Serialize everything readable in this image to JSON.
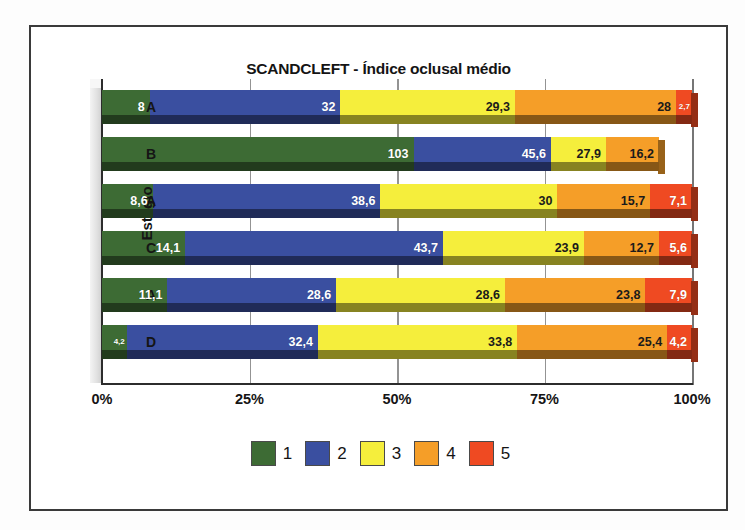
{
  "chart_data": {
    "type": "bar",
    "subtype": "stacked-horizontal-100-percent-3d",
    "title": "SCANDCLEFT - Índice oclusal médio",
    "xlabel": "",
    "ylabel": "Estágio",
    "categories": [
      "A",
      "B",
      "A",
      "C",
      "A",
      "D"
    ],
    "xticks": [
      "0%",
      "25%",
      "50%",
      "75%",
      "100%"
    ],
    "xlim": [
      0,
      100
    ],
    "grid": true,
    "legend": {
      "position": "bottom",
      "entries": [
        {
          "label": "1",
          "color": "#3d6b34"
        },
        {
          "label": "2",
          "color": "#3a4fa0"
        },
        {
          "label": "3",
          "color": "#f5ee3c"
        },
        {
          "label": "4",
          "color": "#f59e28"
        },
        {
          "label": "5",
          "color": "#ef4a22"
        }
      ]
    },
    "series": [
      {
        "name": "1",
        "color": "#3d6b34",
        "values": [
          8,
          103,
          8.6,
          14.1,
          11.1,
          4.2
        ]
      },
      {
        "name": "2",
        "color": "#3a4fa0",
        "values": [
          32,
          45.6,
          38.6,
          43.7,
          28.6,
          32.4
        ]
      },
      {
        "name": "3",
        "color": "#f5ee3c",
        "values": [
          29.3,
          27.9,
          30,
          23.9,
          28.6,
          33.8
        ]
      },
      {
        "name": "4",
        "color": "#f59e28",
        "values": [
          28,
          16.2,
          15.7,
          12.7,
          23.8,
          25.4
        ]
      },
      {
        "name": "5",
        "color": "#ef4a22",
        "values": [
          2.7,
          null,
          7.1,
          5.6,
          7.9,
          4.2
        ]
      }
    ],
    "rows": [
      {
        "category": "A",
        "segments": [
          {
            "series": "1",
            "label": "8",
            "percent": 8.1,
            "color": "#3d6b34",
            "label_color": "white",
            "label_size": "normal"
          },
          {
            "series": "2",
            "label": "32",
            "percent": 32.3,
            "color": "#3a4fa0",
            "label_color": "white",
            "label_size": "normal"
          },
          {
            "series": "3",
            "label": "29,3",
            "percent": 29.6,
            "color": "#f5ee3c",
            "label_color": "dark",
            "label_size": "normal"
          },
          {
            "series": "4",
            "label": "28",
            "percent": 27.3,
            "color": "#f59e28",
            "label_color": "dark",
            "label_size": "normal"
          },
          {
            "series": "5",
            "label": "2,7",
            "percent": 2.7,
            "color": "#ef4a22",
            "label_color": "white",
            "label_size": "small"
          }
        ]
      },
      {
        "category": "B",
        "segments": [
          {
            "series": "1",
            "label": "103",
            "percent": 52.8,
            "color": "#3d6b34",
            "label_color": "white",
            "label_size": "normal"
          },
          {
            "series": "2",
            "label": "45,6",
            "percent": 23.3,
            "color": "#3a4fa0",
            "label_color": "white",
            "label_size": "normal"
          },
          {
            "series": "3",
            "label": "27,9",
            "percent": 9.3,
            "color": "#f5ee3c",
            "label_color": "dark",
            "label_size": "normal"
          },
          {
            "series": "4",
            "label": "16,2",
            "percent": 9.0,
            "color": "#f59e28",
            "label_color": "dark",
            "label_size": "normal"
          }
        ]
      },
      {
        "category": "A",
        "segments": [
          {
            "series": "1",
            "label": "8,6",
            "percent": 8.6,
            "color": "#3d6b34",
            "label_color": "white",
            "label_size": "normal"
          },
          {
            "series": "2",
            "label": "38,6",
            "percent": 38.6,
            "color": "#3a4fa0",
            "label_color": "white",
            "label_size": "normal"
          },
          {
            "series": "3",
            "label": "30",
            "percent": 30.0,
            "color": "#f5ee3c",
            "label_color": "dark",
            "label_size": "normal"
          },
          {
            "series": "4",
            "label": "15,7",
            "percent": 15.7,
            "color": "#f59e28",
            "label_color": "dark",
            "label_size": "normal"
          },
          {
            "series": "5",
            "label": "7,1",
            "percent": 7.1,
            "color": "#ef4a22",
            "label_color": "white",
            "label_size": "normal"
          }
        ]
      },
      {
        "category": "C",
        "segments": [
          {
            "series": "1",
            "label": "14,1",
            "percent": 14.1,
            "color": "#3d6b34",
            "label_color": "white",
            "label_size": "normal"
          },
          {
            "series": "2",
            "label": "43,7",
            "percent": 43.7,
            "color": "#3a4fa0",
            "label_color": "white",
            "label_size": "normal"
          },
          {
            "series": "3",
            "label": "23,9",
            "percent": 23.9,
            "color": "#f5ee3c",
            "label_color": "dark",
            "label_size": "normal"
          },
          {
            "series": "4",
            "label": "12,7",
            "percent": 12.7,
            "color": "#f59e28",
            "label_color": "dark",
            "label_size": "normal"
          },
          {
            "series": "5",
            "label": "5,6",
            "percent": 5.6,
            "color": "#ef4a22",
            "label_color": "white",
            "label_size": "normal"
          }
        ]
      },
      {
        "category": "A",
        "segments": [
          {
            "series": "1",
            "label": "11,1",
            "percent": 11.1,
            "color": "#3d6b34",
            "label_color": "white",
            "label_size": "normal"
          },
          {
            "series": "2",
            "label": "28,6",
            "percent": 28.6,
            "color": "#3a4fa0",
            "label_color": "white",
            "label_size": "normal"
          },
          {
            "series": "3",
            "label": "28,6",
            "percent": 28.6,
            "color": "#f5ee3c",
            "label_color": "dark",
            "label_size": "normal"
          },
          {
            "series": "4",
            "label": "23,8",
            "percent": 23.8,
            "color": "#f59e28",
            "label_color": "dark",
            "label_size": "normal"
          },
          {
            "series": "5",
            "label": "7,9",
            "percent": 7.9,
            "color": "#ef4a22",
            "label_color": "white",
            "label_size": "normal"
          }
        ]
      },
      {
        "category": "D",
        "segments": [
          {
            "series": "1",
            "label": "4,2",
            "percent": 4.2,
            "color": "#3d6b34",
            "label_color": "white",
            "label_size": "small"
          },
          {
            "series": "2",
            "label": "32,4",
            "percent": 32.4,
            "color": "#3a4fa0",
            "label_color": "white",
            "label_size": "normal"
          },
          {
            "series": "3",
            "label": "33,8",
            "percent": 33.8,
            "color": "#f5ee3c",
            "label_color": "dark",
            "label_size": "normal"
          },
          {
            "series": "4",
            "label": "25,4",
            "percent": 25.4,
            "color": "#f59e28",
            "label_color": "dark",
            "label_size": "normal"
          },
          {
            "series": "5",
            "label": "4,2",
            "percent": 4.2,
            "color": "#ef4a22",
            "label_color": "white",
            "label_size": "normal"
          }
        ]
      }
    ]
  }
}
